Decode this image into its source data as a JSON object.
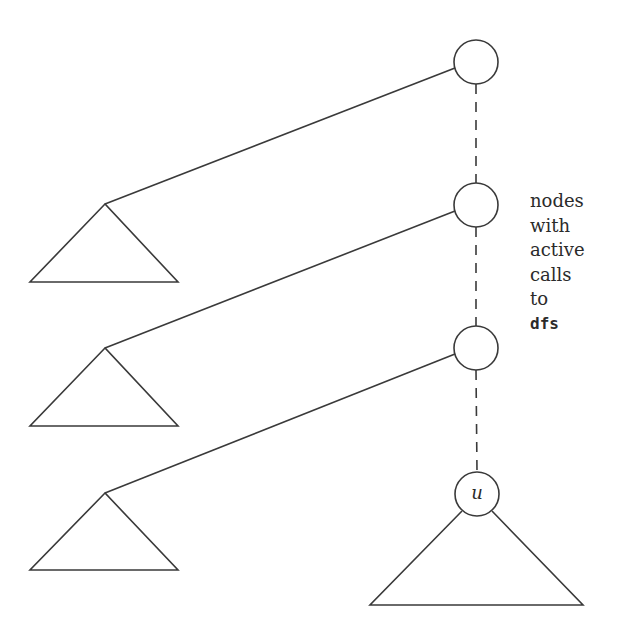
{
  "diagram": {
    "stroke_color": "#3a3a3a",
    "background": "#ffffff",
    "nodes": [
      {
        "id": "n1",
        "cx": 476,
        "cy": 62,
        "r": 22,
        "label": ""
      },
      {
        "id": "n2",
        "cx": 476,
        "cy": 205,
        "r": 22,
        "label": ""
      },
      {
        "id": "n3",
        "cx": 476,
        "cy": 348,
        "r": 22,
        "label": ""
      },
      {
        "id": "u",
        "cx": 477,
        "cy": 494,
        "r": 22,
        "label": "u"
      }
    ],
    "subtrees": [
      {
        "apex": [
          105,
          204
        ],
        "left": [
          30,
          282
        ],
        "right": [
          178,
          282
        ],
        "parent": "n1"
      },
      {
        "apex": [
          105,
          348
        ],
        "left": [
          30,
          426
        ],
        "right": [
          178,
          426
        ],
        "parent": "n2"
      },
      {
        "apex": [
          105,
          493
        ],
        "left": [
          30,
          570
        ],
        "right": [
          178,
          570
        ],
        "parent": "n3"
      },
      {
        "apex": [
          477,
          494
        ],
        "left": [
          370,
          605
        ],
        "right": [
          583,
          605
        ],
        "parent": "u"
      }
    ],
    "path_style": "dashed",
    "annotation": {
      "lines": [
        "nodes",
        "with",
        "active",
        "calls",
        "to"
      ],
      "code": "dfs"
    },
    "u_label": "u"
  }
}
